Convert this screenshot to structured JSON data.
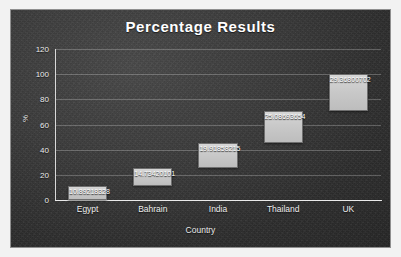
{
  "chart_data": {
    "type": "bar",
    "title": "Percentage Results",
    "xlabel": "Country",
    "ylabel": "%",
    "categories": [
      "Egypt",
      "Bahrain",
      "India",
      "Thailand",
      "UK"
    ],
    "values": [
      10.89218328,
      14.73420101,
      19.91858215,
      25.08693654,
      29.36800702
    ],
    "data_labels": [
      "10.89218328",
      "14.73420101",
      "19.91858215",
      "25.08693654",
      "29.36800702"
    ],
    "cumulative_bases": [
      0,
      10.89218328,
      25.62638429,
      45.54496644,
      70.63190298
    ],
    "stacked_floating": true,
    "ylim": [
      0,
      120
    ],
    "yticks": [
      0,
      20,
      40,
      60,
      80,
      100,
      120
    ],
    "ytick_labels": [
      "0",
      "20",
      "40",
      "60",
      "80",
      "100",
      "120"
    ],
    "grid": true,
    "legend": false,
    "background_color": "#343434",
    "bar_color": "#c9c9c9",
    "bar_border_color": "#6f6f6f",
    "text_color": "#ffffff"
  }
}
